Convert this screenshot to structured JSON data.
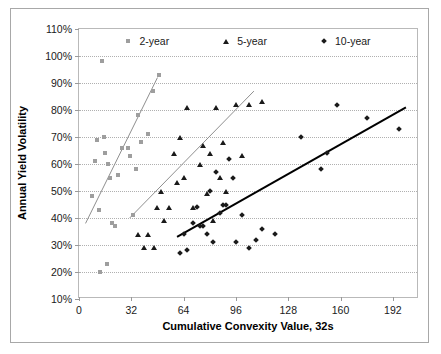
{
  "chart_data": {
    "type": "scatter",
    "title": "",
    "xlabel": "Cumulative Convexity Value, 32s",
    "ylabel": "Annual Yield Volatility",
    "xlim": [
      0,
      208
    ],
    "ylim": [
      10,
      110
    ],
    "xticks": [
      0,
      32,
      64,
      96,
      128,
      160,
      192
    ],
    "xtick_labels": [
      "0",
      "32",
      "64",
      "96",
      "128",
      "160",
      "192"
    ],
    "yticks": [
      10,
      20,
      30,
      40,
      50,
      60,
      70,
      80,
      90,
      100,
      110
    ],
    "ytick_labels": [
      "10%",
      "20%",
      "30%",
      "40%",
      "50%",
      "60%",
      "70%",
      "80%",
      "90%",
      "100%",
      "110%"
    ],
    "grid": "horizontal-dotted",
    "legend_position": "top-inside",
    "series": [
      {
        "name": "2-year",
        "marker": "square",
        "color": "#9e9e9e",
        "points": [
          [
            8,
            48
          ],
          [
            10,
            61
          ],
          [
            11,
            69
          ],
          [
            12,
            43
          ],
          [
            13,
            20
          ],
          [
            14,
            98
          ],
          [
            15,
            70
          ],
          [
            16,
            64
          ],
          [
            17,
            23
          ],
          [
            18,
            60
          ],
          [
            19,
            55
          ],
          [
            20,
            38
          ],
          [
            22,
            37
          ],
          [
            24,
            56
          ],
          [
            26,
            66
          ],
          [
            30,
            66
          ],
          [
            31,
            63
          ],
          [
            33,
            41
          ],
          [
            35,
            58
          ],
          [
            36,
            78
          ],
          [
            38,
            68
          ],
          [
            42,
            71
          ],
          [
            45,
            87
          ],
          [
            49,
            93
          ]
        ],
        "trendline": {
          "x0": 4,
          "y0": 38,
          "x1": 48,
          "y1": 92
        }
      },
      {
        "name": "5-year",
        "marker": "triangle",
        "color": "#1a1a1a",
        "points": [
          [
            36,
            34
          ],
          [
            40,
            29
          ],
          [
            42,
            34
          ],
          [
            46,
            29
          ],
          [
            48,
            44
          ],
          [
            50,
            50
          ],
          [
            52,
            39
          ],
          [
            55,
            44
          ],
          [
            58,
            64
          ],
          [
            60,
            53
          ],
          [
            62,
            70
          ],
          [
            64,
            55
          ],
          [
            66,
            81
          ],
          [
            70,
            44
          ],
          [
            74,
            60
          ],
          [
            76,
            67
          ],
          [
            78,
            49
          ],
          [
            80,
            64
          ],
          [
            82,
            39
          ],
          [
            84,
            81
          ],
          [
            86,
            55
          ],
          [
            88,
            68
          ],
          [
            90,
            50
          ],
          [
            96,
            82
          ],
          [
            100,
            63
          ],
          [
            104,
            82
          ],
          [
            112,
            83
          ]
        ],
        "trendline": {
          "x0": 31,
          "y0": 40,
          "x1": 107,
          "y1": 87
        }
      },
      {
        "name": "10-year",
        "marker": "diamond",
        "color": "#1a1a1a",
        "points": [
          [
            62,
            27
          ],
          [
            64,
            34
          ],
          [
            66,
            28
          ],
          [
            70,
            38
          ],
          [
            72,
            44
          ],
          [
            74,
            37
          ],
          [
            76,
            37
          ],
          [
            78,
            34
          ],
          [
            80,
            50
          ],
          [
            82,
            31
          ],
          [
            84,
            57
          ],
          [
            86,
            42
          ],
          [
            88,
            45
          ],
          [
            90,
            45
          ],
          [
            92,
            62
          ],
          [
            94,
            55
          ],
          [
            96,
            31
          ],
          [
            100,
            41
          ],
          [
            104,
            29
          ],
          [
            108,
            32
          ],
          [
            112,
            36
          ],
          [
            120,
            34
          ],
          [
            136,
            70
          ],
          [
            148,
            58
          ],
          [
            152,
            64
          ],
          [
            158,
            82
          ],
          [
            176,
            77
          ],
          [
            196,
            73
          ]
        ],
        "trendline": {
          "x0": 60,
          "y0": 33,
          "x1": 200,
          "y1": 81
        }
      }
    ],
    "legend": [
      {
        "label": "2-year",
        "marker": "square"
      },
      {
        "label": "5-year",
        "marker": "triangle"
      },
      {
        "label": "10-year",
        "marker": "diamond"
      }
    ]
  }
}
